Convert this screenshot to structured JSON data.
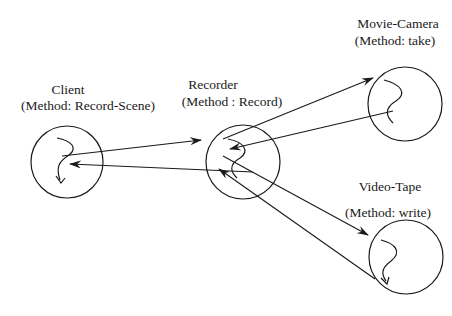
{
  "diagram": {
    "type": "object-interaction",
    "stroke_color": "#1a1a1a",
    "background": "#ffffff",
    "nodes": [
      {
        "id": "client",
        "name": "Client",
        "method": "(Method: Record-Scene)",
        "cx": 67,
        "cy": 162,
        "r": 36,
        "name_x": 68,
        "name_y": 83,
        "method_x": 88,
        "method_y": 99
      },
      {
        "id": "recorder",
        "name": "Recorder",
        "method": "(Method : Record)",
        "cx": 243,
        "cy": 162,
        "r": 37,
        "name_x": 213,
        "name_y": 78,
        "method_x": 232,
        "method_y": 95
      },
      {
        "id": "movie-camera",
        "name": "Movie-Camera",
        "method": "(Method: take)",
        "cx": 405,
        "cy": 104,
        "r": 37,
        "name_x": 398,
        "name_y": 17,
        "method_x": 395,
        "method_y": 34
      },
      {
        "id": "video-tape",
        "name": "Video-Tape",
        "method": "(Method: write)",
        "cx": 406,
        "cy": 257,
        "r": 37,
        "name_x": 390,
        "name_y": 180,
        "method_x": 388,
        "method_y": 206
      }
    ],
    "edges": [
      {
        "from": "client",
        "to": "recorder",
        "x1": 62,
        "y1": 156,
        "x2": 201,
        "y2": 140
      },
      {
        "from": "recorder",
        "to": "client",
        "x1": 253,
        "y1": 172,
        "x2": 70,
        "y2": 164
      },
      {
        "from": "recorder",
        "to": "movie-camera",
        "x1": 223,
        "y1": 139,
        "x2": 373,
        "y2": 78
      },
      {
        "from": "movie-camera",
        "to": "recorder",
        "x1": 393,
        "y1": 111,
        "x2": 230,
        "y2": 149
      },
      {
        "from": "recorder",
        "to": "video-tape",
        "x1": 223,
        "y1": 156,
        "x2": 368,
        "y2": 235
      },
      {
        "from": "video-tape",
        "to": "recorder",
        "x1": 375,
        "y1": 279,
        "x2": 219,
        "y2": 169
      }
    ]
  }
}
